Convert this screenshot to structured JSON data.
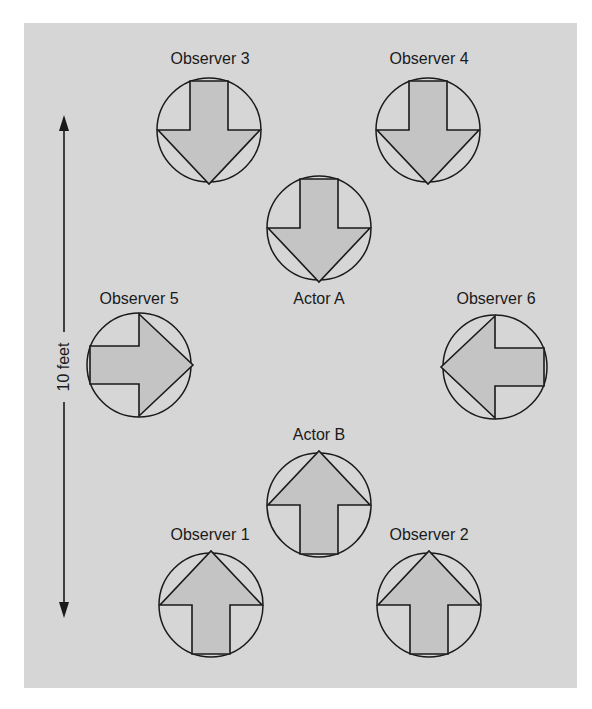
{
  "colors": {
    "background": "#ffffff",
    "panel": "#d6d6d6",
    "arrow_fill": "#c4c4c4",
    "stroke": "#1a1a1a"
  },
  "dimension": {
    "label": "10 feet",
    "icon": "double-headed-vertical-arrow"
  },
  "figures": [
    {
      "id": "observer-3",
      "label": "Observer 3",
      "direction": "down",
      "icon": "arrow-down-in-circle"
    },
    {
      "id": "observer-4",
      "label": "Observer 4",
      "direction": "down",
      "icon": "arrow-down-in-circle"
    },
    {
      "id": "actor-a",
      "label": "Actor A",
      "direction": "down",
      "icon": "arrow-down-in-circle"
    },
    {
      "id": "observer-5",
      "label": "Observer 5",
      "direction": "right",
      "icon": "arrow-right-in-circle"
    },
    {
      "id": "observer-6",
      "label": "Observer 6",
      "direction": "left",
      "icon": "arrow-left-in-circle"
    },
    {
      "id": "actor-b",
      "label": "Actor B",
      "direction": "up",
      "icon": "arrow-up-in-circle"
    },
    {
      "id": "observer-1",
      "label": "Observer 1",
      "direction": "up",
      "icon": "arrow-up-in-circle"
    },
    {
      "id": "observer-2",
      "label": "Observer 2",
      "direction": "up",
      "icon": "arrow-up-in-circle"
    }
  ]
}
